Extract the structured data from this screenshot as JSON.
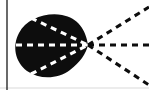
{
  "figure": {
    "name": "caustic-ray-diagram",
    "title": "Cardioid caustic with converging and diverging dashed rays",
    "width": 149,
    "height": 90,
    "background_color": "#ffffff",
    "ink_color": "#0d0d0d",
    "border": {
      "left_axis": {
        "label": "left-vertical-rule",
        "x": 7,
        "y_top": 0,
        "y_bottom": 90,
        "width": 1.3,
        "color": "#1a1a1a"
      },
      "bottom_edge": {
        "label": "bottom-rule",
        "y": 88,
        "color": "#d9d9d9",
        "width": 1
      }
    }
  },
  "chart_data": {
    "type": "scatter",
    "title": "Cardioid caustic with converging and diverging dashed rays",
    "xlabel": "",
    "ylabel": "",
    "xlim": [
      0,
      149
    ],
    "ylim": [
      0,
      90
    ],
    "grid": false,
    "legend": "none",
    "focal_point": {
      "label": "cusp",
      "x": 88,
      "y": 45
    },
    "caustic_region": {
      "label": "cardioid-caustic-blob",
      "fill": "#0d0d0d",
      "bounds": {
        "left": 17,
        "right": 88,
        "top": 14,
        "bottom": 79
      },
      "center": {
        "x": 50,
        "y": 46
      },
      "radius_x": 34,
      "radius_y": 33,
      "path": "M 88 45 C 86 30 78 18 62 15 C 46 12 26 19 19 33 C 12 46 15 62 27 71 C 40 80 58 79 70 70 C 80 62 86 54 88 45 Z"
    },
    "series": [
      {
        "name": "internal-dashed-rays",
        "style": "dashed",
        "color": "#ffffff",
        "dash_pattern": "6 5",
        "width": 3.1,
        "values": [
          {
            "label": "internal-ray-axis",
            "x1": 16,
            "y1": 45,
            "x2": 88,
            "y2": 45
          },
          {
            "label": "internal-ray-upper",
            "x1": 31,
            "y1": 18,
            "x2": 88,
            "y2": 45
          },
          {
            "label": "internal-ray-lower",
            "x1": 31,
            "y1": 74,
            "x2": 88,
            "y2": 45
          }
        ]
      },
      {
        "name": "external-dashed-rays",
        "style": "dashed",
        "color": "#0d0d0d",
        "dash_pattern": "6 5",
        "width": 3.1,
        "values": [
          {
            "label": "external-ray-upper",
            "x1": 88,
            "y1": 45,
            "x2": 149,
            "y2": 7
          },
          {
            "label": "external-ray-axis",
            "x1": 88,
            "y1": 45,
            "x2": 149,
            "y2": 45
          },
          {
            "label": "external-ray-lower",
            "x1": 88,
            "y1": 45,
            "x2": 149,
            "y2": 85
          }
        ]
      }
    ],
    "annotations": []
  }
}
